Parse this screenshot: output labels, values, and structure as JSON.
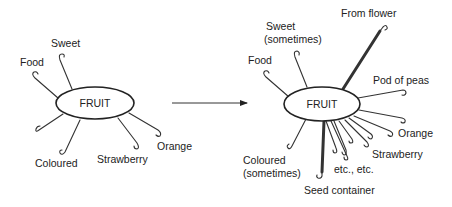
{
  "diagram": {
    "before": {
      "core_label": "FRUIT",
      "hooks": [
        {
          "label": "Sweet"
        },
        {
          "label": "Food"
        },
        {
          "label": ""
        },
        {
          "label": "Coloured"
        },
        {
          "label": "Strawberry"
        },
        {
          "label": "Orange"
        }
      ]
    },
    "transition": {
      "arrow": "arrow-right"
    },
    "after": {
      "core_label": "FRUIT",
      "hooks": [
        {
          "label": "From flower",
          "emphasis": "strong"
        },
        {
          "label_lines": [
            "Sweet",
            "(sometimes)"
          ]
        },
        {
          "label": "Food"
        },
        {
          "label": "Pod of peas"
        },
        {
          "label": "Orange"
        },
        {
          "label": "Strawberry"
        },
        {
          "label": "etc., etc."
        },
        {
          "label_lines": [
            "Coloured",
            "(sometimes)"
          ]
        },
        {
          "label": "Seed container",
          "emphasis": "strong"
        }
      ]
    }
  }
}
